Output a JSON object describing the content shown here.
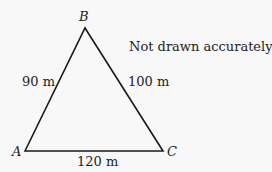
{
  "diagram": {
    "type": "triangle",
    "vertices": [
      {
        "name": "A",
        "x": 25,
        "y": 151
      },
      {
        "name": "B",
        "x": 85,
        "y": 28
      },
      {
        "name": "C",
        "x": 163,
        "y": 151
      }
    ],
    "sides": {
      "AB": "90 m",
      "BC": "100 m",
      "AC": "120 m"
    },
    "note": "Not drawn accurately",
    "stroke_color": "#1a1a1a"
  }
}
